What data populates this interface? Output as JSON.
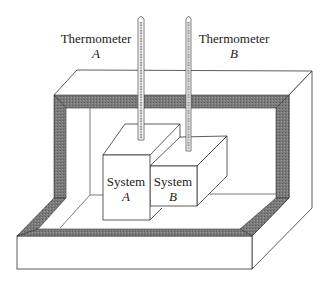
{
  "figure": {
    "labels": {
      "thermometer_a": {
        "line1": "Thermometer",
        "line2": "A"
      },
      "thermometer_b": {
        "line1": "Thermometer",
        "line2": "B"
      },
      "system_a": {
        "line1": "System",
        "line2": "A"
      },
      "system_b": {
        "line1": "System",
        "line2": "B"
      }
    },
    "colors": {
      "line": "#333333",
      "wall_band": "#6e6e6e",
      "background": "#ffffff"
    }
  }
}
